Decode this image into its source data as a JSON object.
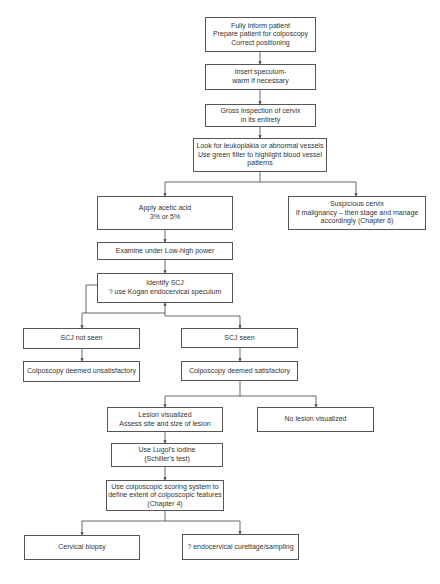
{
  "diagram": {
    "type": "flowchart",
    "nodes": [
      {
        "id": "inform",
        "lines": [
          "Fully inform patient",
          "Prepare patient for colposcopy",
          "Correct positioning"
        ]
      },
      {
        "id": "speculum",
        "lines": [
          "Insert speculum-",
          "warm if necessary"
        ]
      },
      {
        "id": "gross",
        "lines": [
          "Gross inspection of cervix",
          "in its entirety"
        ]
      },
      {
        "id": "leukoplakia",
        "lines": [
          "Look for leukoplakia or abnormal vessels",
          "Use green filter to highlight blood vessel",
          "patterns"
        ]
      },
      {
        "id": "acetic",
        "lines": [
          "Apply acetic acid",
          "3% or 5%"
        ]
      },
      {
        "id": "suspicious",
        "lines": [
          "Suspicious cervix",
          "If malignancy – then stage and manage",
          "accordingly (Chapter 6)"
        ]
      },
      {
        "id": "examine",
        "lines": [
          "Examine under Low-high power"
        ]
      },
      {
        "id": "identify",
        "lines": [
          "Identify SCJ",
          "? use Kogan endocervical speculum"
        ]
      },
      {
        "id": "notseen",
        "lines": [
          "SCJ not seen"
        ]
      },
      {
        "id": "seen",
        "lines": [
          "SCJ seen"
        ]
      },
      {
        "id": "unsat",
        "lines": [
          "Colposcopy deemed unsatisfactory"
        ]
      },
      {
        "id": "sat",
        "lines": [
          "Colposcopy deemed satisfactory"
        ]
      },
      {
        "id": "lesion",
        "lines": [
          "Lesion visualized",
          "Assess site and size of lesion"
        ]
      },
      {
        "id": "nolesion",
        "lines": [
          "No lesion visualized"
        ]
      },
      {
        "id": "lugol",
        "lines": [
          "Use Lugol's iodine",
          "(Schiller's test)"
        ]
      },
      {
        "id": "scoring",
        "lines": [
          "Use colposcopic scoring system to",
          "define extent of colposcopic features",
          "(Chapter 4)"
        ]
      },
      {
        "id": "biopsy",
        "lines": [
          "Cervical biopsy"
        ]
      },
      {
        "id": "curettage",
        "lines": [
          "? endocervical curettage/sampling"
        ]
      }
    ],
    "edges": [
      [
        "inform",
        "speculum"
      ],
      [
        "speculum",
        "gross"
      ],
      [
        "gross",
        "leukoplakia"
      ],
      [
        "leukoplakia",
        "acetic"
      ],
      [
        "leukoplakia",
        "suspicious"
      ],
      [
        "acetic",
        "examine"
      ],
      [
        "examine",
        "identify"
      ],
      [
        "identify",
        "notseen"
      ],
      [
        "identify",
        "seen"
      ],
      [
        "notseen",
        "unsat"
      ],
      [
        "seen",
        "sat"
      ],
      [
        "sat",
        "lesion"
      ],
      [
        "sat",
        "nolesion"
      ],
      [
        "lesion",
        "lugol"
      ],
      [
        "lugol",
        "scoring"
      ],
      [
        "scoring",
        "biopsy"
      ],
      [
        "scoring",
        "curettage"
      ]
    ],
    "colors": {
      "line": "#444444",
      "border": "#555555",
      "text": "#333333",
      "background": "#ffffff"
    }
  }
}
